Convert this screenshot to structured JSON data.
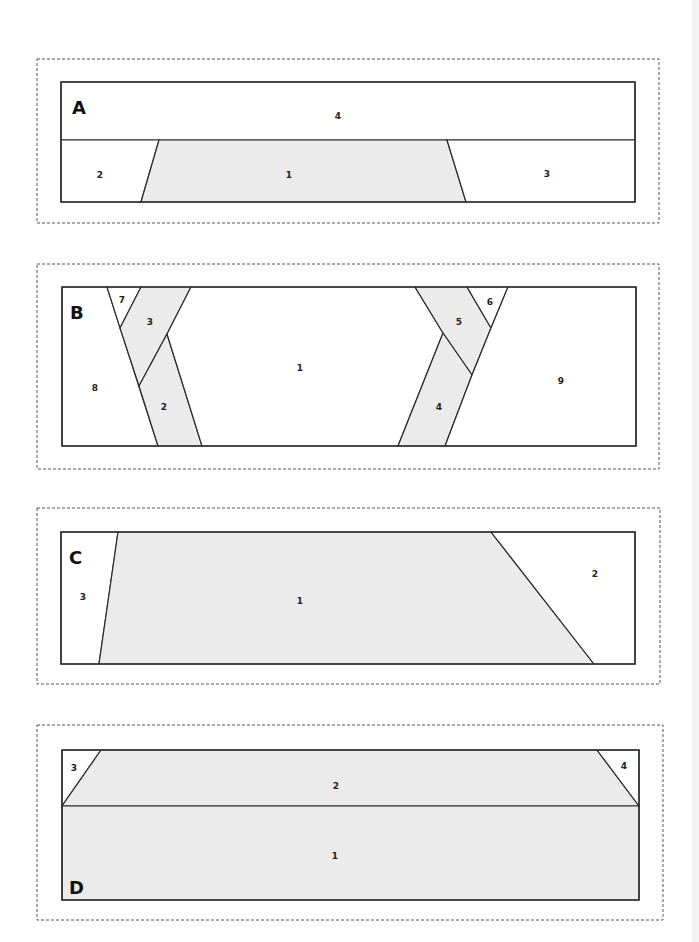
{
  "colors": {
    "shaded": "#ebebeb",
    "white": "#ffffff",
    "stroke": "#2a2a2a",
    "dash": "#555555",
    "page_edge": "#f3f3f3"
  },
  "panels": [
    {
      "letter": "A",
      "letter_pos": [
        72,
        107
      ],
      "dash_box": [
        37,
        59,
        622,
        164
      ],
      "outline": [
        61,
        82,
        574,
        120
      ],
      "pieces": [
        {
          "label": "4",
          "fill": "white",
          "points": [
            [
              61,
              82
            ],
            [
              635,
              82
            ],
            [
              635,
              140
            ],
            [
              61,
              140
            ]
          ],
          "label_pos": [
            338,
            116
          ]
        },
        {
          "label": "2",
          "fill": "white",
          "points": [
            [
              61,
              140
            ],
            [
              159,
              140
            ],
            [
              141,
              202
            ],
            [
              61,
              202
            ]
          ],
          "label_pos": [
            100,
            175
          ]
        },
        {
          "label": "1",
          "fill": "shaded",
          "points": [
            [
              159,
              140
            ],
            [
              447,
              140
            ],
            [
              466,
              202
            ],
            [
              141,
              202
            ]
          ],
          "label_pos": [
            289,
            175
          ]
        },
        {
          "label": "3",
          "fill": "white",
          "points": [
            [
              447,
              140
            ],
            [
              635,
              140
            ],
            [
              635,
              202
            ],
            [
              466,
              202
            ]
          ],
          "label_pos": [
            547,
            174
          ]
        }
      ]
    },
    {
      "letter": "B",
      "letter_pos": [
        70,
        312
      ],
      "dash_box": [
        37,
        264,
        622,
        205
      ],
      "outline": [
        62,
        287,
        574,
        159
      ],
      "pieces": [
        {
          "label": "8",
          "fill": "white",
          "points": [
            [
              62,
              287
            ],
            [
              107,
              287
            ],
            [
              158,
              446
            ],
            [
              62,
              446
            ]
          ],
          "label_pos": [
            95,
            388
          ]
        },
        {
          "label": "7",
          "fill": "white",
          "points": [
            [
              107,
              287
            ],
            [
              141,
              287
            ],
            [
              120,
              328
            ]
          ],
          "label_pos": [
            122,
            300
          ]
        },
        {
          "label": "3",
          "fill": "shaded",
          "points": [
            [
              141,
              287
            ],
            [
              191,
              287
            ],
            [
              167,
              334
            ],
            [
              139,
              386
            ],
            [
              120,
              328
            ]
          ],
          "label_pos": [
            150,
            322
          ]
        },
        {
          "label": "2",
          "fill": "shaded",
          "points": [
            [
              167,
              334
            ],
            [
              202,
              446
            ],
            [
              158,
              446
            ],
            [
              139,
              386
            ]
          ],
          "label_pos": [
            164,
            407
          ]
        },
        {
          "label": "1",
          "fill": "white",
          "points": [
            [
              191,
              287
            ],
            [
              415,
              287
            ],
            [
              443,
              333
            ],
            [
              398,
              446
            ],
            [
              202,
              446
            ],
            [
              167,
              334
            ]
          ],
          "label_pos": [
            300,
            368
          ]
        },
        {
          "label": "5",
          "fill": "shaded",
          "points": [
            [
              415,
              287
            ],
            [
              467,
              287
            ],
            [
              491,
              328
            ],
            [
              472,
              375
            ],
            [
              443,
              333
            ]
          ],
          "label_pos": [
            459,
            322
          ]
        },
        {
          "label": "6",
          "fill": "white",
          "points": [
            [
              467,
              287
            ],
            [
              508,
              287
            ],
            [
              491,
              328
            ]
          ],
          "label_pos": [
            490,
            302
          ]
        },
        {
          "label": "4",
          "fill": "shaded",
          "points": [
            [
              443,
              333
            ],
            [
              472,
              375
            ],
            [
              445,
              446
            ],
            [
              398,
              446
            ]
          ],
          "label_pos": [
            439,
            407
          ]
        },
        {
          "label": "9",
          "fill": "white",
          "points": [
            [
              508,
              287
            ],
            [
              636,
              287
            ],
            [
              636,
              446
            ],
            [
              445,
              446
            ],
            [
              472,
              375
            ],
            [
              491,
              328
            ]
          ],
          "label_pos": [
            561,
            381
          ]
        }
      ]
    },
    {
      "letter": "C",
      "letter_pos": [
        69,
        557
      ],
      "dash_box": [
        37,
        508,
        623,
        176
      ],
      "outline": [
        61,
        532,
        574,
        132
      ],
      "pieces": [
        {
          "label": "3",
          "fill": "white",
          "points": [
            [
              61,
              532
            ],
            [
              118,
              532
            ],
            [
              99,
              664
            ],
            [
              61,
              664
            ]
          ],
          "label_pos": [
            83,
            597
          ]
        },
        {
          "label": "1",
          "fill": "shaded",
          "points": [
            [
              118,
              532
            ],
            [
              491,
              532
            ],
            [
              594,
              664
            ],
            [
              99,
              664
            ]
          ],
          "label_pos": [
            300,
            601
          ]
        },
        {
          "label": "2",
          "fill": "white",
          "points": [
            [
              491,
              532
            ],
            [
              635,
              532
            ],
            [
              635,
              664
            ],
            [
              594,
              664
            ]
          ],
          "label_pos": [
            595,
            574
          ]
        }
      ]
    },
    {
      "letter": "D",
      "letter_pos": [
        69,
        887
      ],
      "dash_box": [
        37,
        725,
        626,
        195
      ],
      "outline": [
        62,
        750,
        577,
        150
      ],
      "pieces": [
        {
          "label": "3",
          "fill": "white",
          "points": [
            [
              62,
              750
            ],
            [
              101,
              750
            ],
            [
              62,
              806
            ]
          ],
          "label_pos": [
            74,
            768
          ]
        },
        {
          "label": "2",
          "fill": "shaded",
          "points": [
            [
              101,
              750
            ],
            [
              597,
              750
            ],
            [
              639,
              806
            ],
            [
              62,
              806
            ]
          ],
          "label_pos": [
            336,
            786
          ]
        },
        {
          "label": "4",
          "fill": "white",
          "points": [
            [
              597,
              750
            ],
            [
              639,
              750
            ],
            [
              639,
              806
            ]
          ],
          "label_pos": [
            624,
            766
          ]
        },
        {
          "label": "1",
          "fill": "shaded",
          "points": [
            [
              62,
              806
            ],
            [
              639,
              806
            ],
            [
              639,
              900
            ],
            [
              62,
              900
            ]
          ],
          "label_pos": [
            335,
            856
          ]
        }
      ]
    }
  ]
}
